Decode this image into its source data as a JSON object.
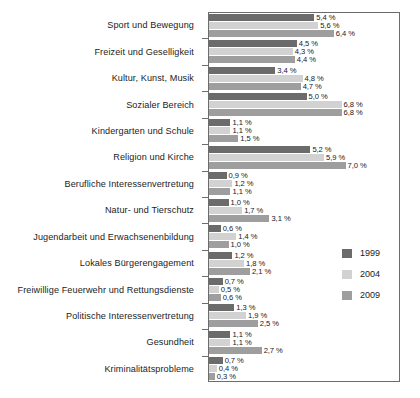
{
  "chart_data": {
    "type": "bar",
    "orientation": "horizontal",
    "title": "",
    "subtitle": "",
    "xlabel": "",
    "ylabel": "",
    "xlim": [
      0,
      9.8
    ],
    "grid": false,
    "legend_position": "right",
    "value_suffix": "%",
    "decimal_separator": ",",
    "categories": [
      "Sport und Bewegung",
      "Freizeit und Geselligkeit",
      "Kultur, Kunst, Musik",
      "Sozialer Bereich",
      "Kindergarten und Schule",
      "Religion und Kirche",
      "Berufliche Interessenvertretung",
      "Natur- und Tierschutz",
      "Jugendarbeit und Erwachsenenbildung",
      "Lokales Bürgerengagement",
      "Freiwillige Feuerwehr und Rettungsdienste",
      "Politische Interessenvertretung",
      "Gesundheit",
      "Kriminalitätsprobleme"
    ],
    "series": [
      {
        "name": "1999",
        "color": "#6b6b6b",
        "values": [
          5.4,
          4.5,
          3.4,
          5.0,
          1.1,
          5.2,
          0.9,
          1.0,
          0.6,
          1.2,
          0.7,
          1.3,
          1.1,
          0.7
        ],
        "labels": [
          "5,4 %",
          "4,5 %",
          "3,4 %",
          "5,0 %",
          "1,1 %",
          "5,2 %",
          "0,9 %",
          "1,0 %",
          "0,6 %",
          "1,2 %",
          "0,7 %",
          "1,3 %",
          "1,1 %",
          "0,7 %"
        ]
      },
      {
        "name": "2004",
        "color": "#d2d2d2",
        "values": [
          5.6,
          4.3,
          4.8,
          6.8,
          1.1,
          5.9,
          1.2,
          1.7,
          1.4,
          1.8,
          0.5,
          1.9,
          1.1,
          0.4
        ],
        "labels": [
          "5,6 %",
          "4,3 %",
          "4,8 %",
          "6,8 %",
          "1,1 %",
          "5,9 %",
          "1,2 %",
          "1,7 %",
          "1,4 %",
          "1,8 %",
          "0,5 %",
          "1,9 %",
          "1,1 %",
          "0,4 %"
        ]
      },
      {
        "name": "2009",
        "color": "#9e9e9e",
        "values": [
          6.4,
          4.4,
          4.7,
          6.8,
          1.5,
          7.0,
          1.1,
          3.1,
          1.0,
          2.1,
          0.6,
          2.5,
          2.7,
          0.3
        ],
        "labels": [
          "6,4 %",
          "4,4 %",
          "4,7 %",
          "6,8 %",
          "1,5 %",
          "7,0 %",
          "1,1 %",
          "3,1 %",
          "1,0 %",
          "2,1 %",
          "0,6 %",
          "2,5 %",
          "2,7 %",
          "0,3 %"
        ]
      }
    ],
    "legend": [
      {
        "label": "1999",
        "color": "#6b6b6b"
      },
      {
        "label": "2004",
        "color": "#d2d2d2"
      },
      {
        "label": "2009",
        "color": "#9e9e9e"
      }
    ]
  }
}
